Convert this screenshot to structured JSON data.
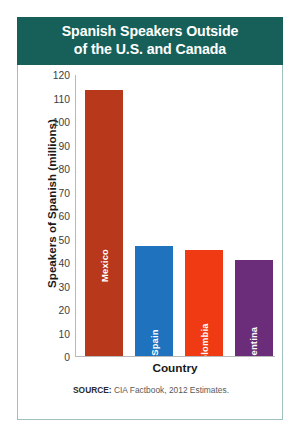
{
  "chart_data": {
    "type": "bar",
    "title": "Spanish Speakers Outside\nof the U.S. and Canada",
    "title_line1": "Spanish Speakers Outside",
    "title_line2": "of the U.S. and Canada",
    "xlabel": "Country",
    "ylabel": "Speakers of Spanish (millions)",
    "ylim": [
      0,
      120
    ],
    "ytick_step": 10,
    "yticks": [
      120,
      110,
      100,
      90,
      80,
      70,
      60,
      50,
      40,
      30,
      20,
      10,
      0
    ],
    "categories": [
      "Mexico",
      "Spain",
      "Colombia",
      "Argentina"
    ],
    "values": [
      113,
      47,
      45,
      41
    ],
    "colors": [
      "#B8381C",
      "#1E72BE",
      "#F03A14",
      "#6B2D7A"
    ],
    "series": [
      {
        "name": "Speakers of Spanish (millions)",
        "values": [
          113,
          47,
          45,
          41
        ]
      }
    ],
    "bars": [
      {
        "label": "Mexico",
        "value": 113,
        "color": "#B8381C"
      },
      {
        "label": "Spain",
        "value": 47,
        "color": "#1E72BE"
      },
      {
        "label": "Colombia",
        "value": 45,
        "color": "#F03A14"
      },
      {
        "label": "Argentina",
        "value": 41,
        "color": "#6B2D7A"
      }
    ],
    "grid": false,
    "legend": "none",
    "source_label": "SOURCE:",
    "source_text": " CIA Factbook, 2012 Estimates.",
    "header_color": "#17605A",
    "border_color": "#9FC0BD"
  }
}
